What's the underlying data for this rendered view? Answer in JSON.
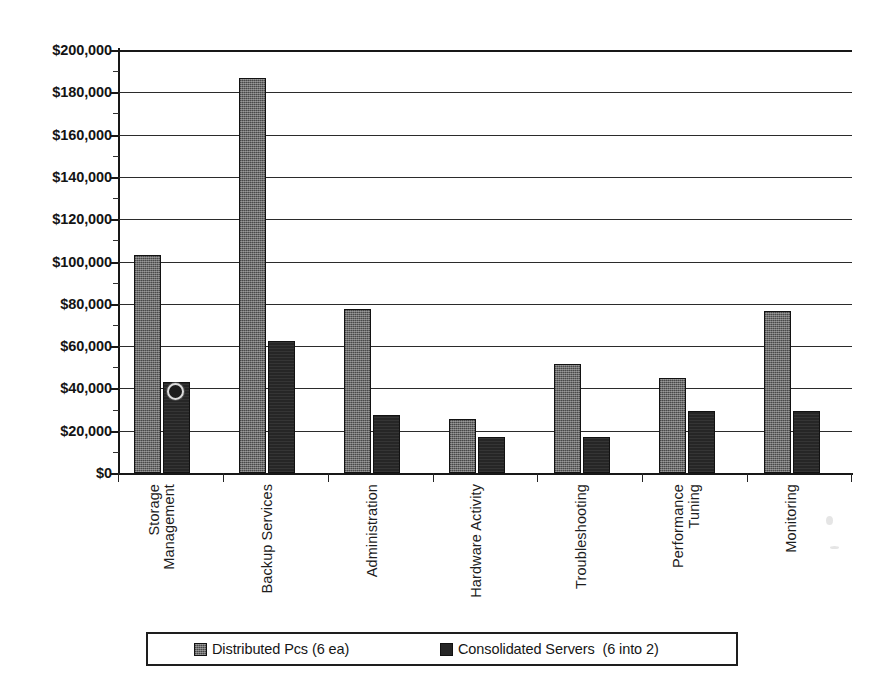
{
  "chart_data": {
    "type": "bar",
    "title": "",
    "xlabel": "",
    "ylabel": "",
    "ylim": [
      0,
      200000
    ],
    "ytick_step": 20000,
    "grid": true,
    "legend_position": "bottom",
    "currency_prefix": "$",
    "categories": [
      "Storage Management",
      "Backup Services",
      "Administration",
      "Hardware Activity",
      "Troubleshooting",
      "Performance Tuning",
      "Monitoring"
    ],
    "category_lines": [
      [
        "Storage",
        "Management"
      ],
      [
        "Backup Services"
      ],
      [
        "Administration"
      ],
      [
        "Hardware Activity"
      ],
      [
        "Troubleshooting"
      ],
      [
        "Performance",
        "Tuning"
      ],
      [
        "Monitoring"
      ]
    ],
    "ytick_labels": [
      "$200,000",
      "$180,000",
      "$160,000",
      "$140,000",
      "$120,000",
      "$100,000",
      "$80,000",
      "$60,000",
      "$40,000",
      "$20,000",
      "$0"
    ],
    "ytick_values": [
      200000,
      180000,
      160000,
      140000,
      120000,
      100000,
      80000,
      60000,
      40000,
      20000,
      0
    ],
    "series": [
      {
        "name": "Distributed Pcs (6 ea)",
        "key": "series-a",
        "color": "#6b6b6b",
        "pattern": "dotted-hatch",
        "values": [
          103000,
          187000,
          77500,
          25500,
          51500,
          45000,
          76500
        ]
      },
      {
        "name": "Consolidated Servers  (6 into 2)",
        "key": "series-b",
        "color": "#262626",
        "pattern": "solid",
        "values": [
          43000,
          62500,
          27500,
          17000,
          17000,
          29500,
          29500
        ]
      }
    ]
  },
  "legend": {
    "entries": [
      {
        "label": "Distributed Pcs (6 ea)",
        "swatch": "series-a"
      },
      {
        "label": "Consolidated Servers  (6 into 2)",
        "swatch": "series-b"
      }
    ]
  }
}
